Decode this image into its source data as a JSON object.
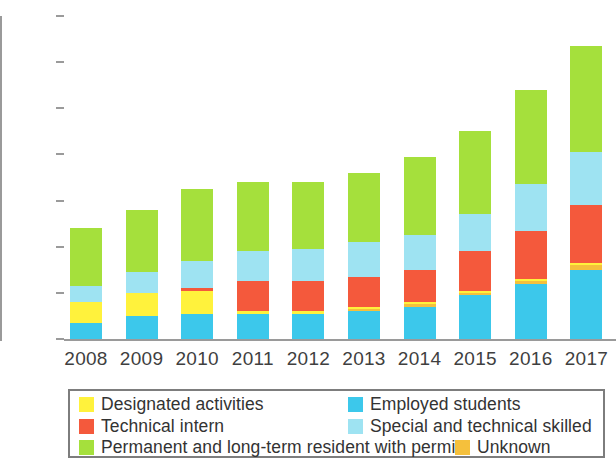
{
  "chart_data": {
    "type": "bar",
    "stacked": true,
    "title": "",
    "subtitle": "",
    "xlabel": "",
    "ylabel": "",
    "categories": [
      "2008",
      "2009",
      "2010",
      "2011",
      "2012",
      "2013",
      "2014",
      "2015",
      "2016",
      "2017"
    ],
    "ylim": [
      0.0,
      1.4
    ],
    "yticks": [
      "0.0",
      "0.2",
      "0.4",
      "0.6",
      "0.8",
      "1.0",
      "1.2",
      "1.4"
    ],
    "ytick_values": [
      0.0,
      0.2,
      0.4,
      0.6,
      0.8,
      1.0,
      1.2,
      1.4
    ],
    "grid": false,
    "legend_position": "bottom",
    "stack_order_bottom_to_top": [
      "Employed students",
      "Unknown",
      "Designated activities",
      "Technical intern",
      "Special and technical skilled",
      "Permanent and long-term resident with permit"
    ],
    "series": [
      {
        "name": "Employed students",
        "color": "#3CC8EB",
        "values": [
          0.07,
          0.1,
          0.11,
          0.11,
          0.11,
          0.12,
          0.14,
          0.19,
          0.24,
          0.3
        ]
      },
      {
        "name": "Unknown",
        "color": "#F5C03C",
        "values": [
          0.0,
          0.0,
          0.0,
          0.0,
          0.0,
          0.01,
          0.01,
          0.01,
          0.01,
          0.02
        ]
      },
      {
        "name": "Designated activities",
        "color": "#FFF23C",
        "values": [
          0.09,
          0.1,
          0.1,
          0.01,
          0.01,
          0.01,
          0.01,
          0.01,
          0.01,
          0.01
        ]
      },
      {
        "name": "Technical intern",
        "color": "#F4593C",
        "values": [
          0.0,
          0.0,
          0.01,
          0.13,
          0.13,
          0.13,
          0.14,
          0.17,
          0.21,
          0.25
        ]
      },
      {
        "name": "Special and technical skilled",
        "color": "#9EE3F2",
        "values": [
          0.07,
          0.09,
          0.12,
          0.13,
          0.14,
          0.15,
          0.15,
          0.16,
          0.2,
          0.23
        ]
      },
      {
        "name": "Permanent and long-term resident with permit",
        "color": "#A5E03C",
        "values": [
          0.25,
          0.27,
          0.31,
          0.3,
          0.29,
          0.3,
          0.34,
          0.36,
          0.41,
          0.46
        ]
      }
    ],
    "totals": [
      0.48,
      0.56,
      0.65,
      0.68,
      0.68,
      0.72,
      0.79,
      0.9,
      1.08,
      1.27
    ]
  },
  "legend": {
    "rows": [
      {
        "left": {
          "label": "Designated activities",
          "swatch": "#FFF23C"
        },
        "right": {
          "label": "Employed students",
          "swatch": "#3CC8EB"
        }
      },
      {
        "left": {
          "label": "Technical intern",
          "swatch": "#F4593C"
        },
        "right": {
          "label": "Special and technical skilled",
          "swatch": "#9EE3F2"
        }
      },
      {
        "left": {
          "label": "Permanent and long-term resident with permit",
          "swatch": "#A5E03C"
        },
        "right": {
          "label": "Unknown",
          "swatch": "#F5C03C"
        }
      }
    ]
  },
  "colors": {
    "axis": "#9a9a9a",
    "text": "#3f3f3f",
    "legend_border": "#7d7d7d",
    "background": "#ffffff"
  }
}
